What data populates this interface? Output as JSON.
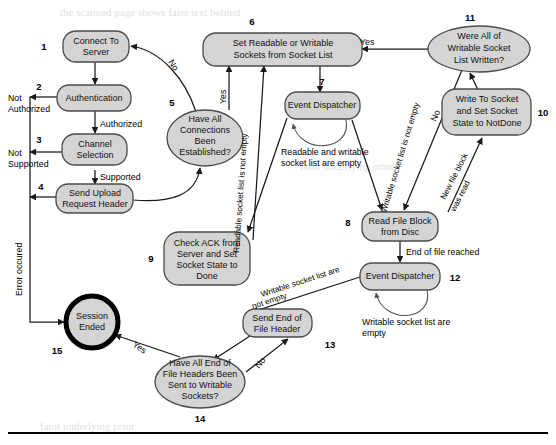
{
  "diagram": {
    "colors": {
      "node_fill": "#d4d4d4",
      "node_stroke": "#4a4a4a",
      "edge": "#1a1a1a",
      "terminal_stroke": "#000000"
    },
    "nodes": [
      {
        "num": "1",
        "label": "Connect To Server",
        "lines": [
          "Connect To",
          "Server"
        ]
      },
      {
        "num": "2",
        "label": "Authentication",
        "lines": [
          "Authentication"
        ]
      },
      {
        "num": "3",
        "label": "Channel Selection",
        "lines": [
          "Channel",
          "Selection"
        ]
      },
      {
        "num": "4",
        "label": "Send Upload Request Header",
        "lines": [
          "Send Upload",
          "Request Header"
        ]
      },
      {
        "num": "5",
        "label": "Have All Connections Been Established?",
        "lines": [
          "Have All",
          "Connections",
          "Been",
          "Established?"
        ]
      },
      {
        "num": "6",
        "label": "Set Readable or Writable Sockets from Socket List",
        "lines": [
          "Set Readable or Writable",
          "Sockets from Socket List"
        ]
      },
      {
        "num": "7",
        "label": "Event Dispatcher",
        "lines": [
          "Event Dispatcher"
        ]
      },
      {
        "num": "8",
        "label": "Read File Block from Disc",
        "lines": [
          "Read File Block",
          "from Disc"
        ]
      },
      {
        "num": "9",
        "label": "Check ACK from Server and Set Socket State to Done",
        "lines": [
          "Check ACK from",
          "Server and Set",
          "Socket State to",
          "Done"
        ]
      },
      {
        "num": "10",
        "label": "Write To Socket and Set Socket State to NotDone",
        "lines": [
          "Write To Socket",
          "and Set Socket",
          "State to NotDone"
        ]
      },
      {
        "num": "11",
        "label": "Were All of Writable Socket List Written?",
        "lines": [
          "Were All of",
          "Writable Socket",
          "List Written?"
        ]
      },
      {
        "num": "12",
        "label": "Event Dispatcher",
        "lines": [
          "Event Dispatcher"
        ]
      },
      {
        "num": "13",
        "label": "Send End of File Header",
        "lines": [
          "Send End of",
          "File Header"
        ]
      },
      {
        "num": "14",
        "label": "Have All End of File Headers Been Sent to Writable Sockets?",
        "lines": [
          "Have All End of",
          "File Headers Been",
          "Sent to Writable",
          "Sockets?"
        ]
      },
      {
        "num": "15",
        "label": "Session Ended",
        "lines": [
          "Session",
          "Ended"
        ]
      }
    ],
    "edge_labels": {
      "not_authorized": [
        "Not",
        "Authorized"
      ],
      "authorized": "Authorized",
      "not_supported": [
        "Not",
        "Supported"
      ],
      "supported": "Supported",
      "no_from_connections": "No",
      "yes_from_connections": "Yes",
      "yes_from_written": "Yes",
      "no_from_written": "No",
      "readable_socket_list_not_empty": "Readable socket list is not empty",
      "writable_socket_list_not_empty_7": "Writable socket list is not empty",
      "readable_and_writable_empty": [
        "Readable and writable",
        "socket list are empty"
      ],
      "new_file_block_was_read": [
        "New file block",
        "was read"
      ],
      "end_of_file_reached": "End of file reached",
      "writable_socket_list_empty": [
        "Writable socket list are",
        "empty"
      ],
      "writable_socket_list_are_not_empty": [
        "Writable socket list are",
        "not empty"
      ],
      "yes_to_session_ended": "Yes",
      "no_to_send_eof": "No",
      "error_occured": "Error occured"
    }
  }
}
